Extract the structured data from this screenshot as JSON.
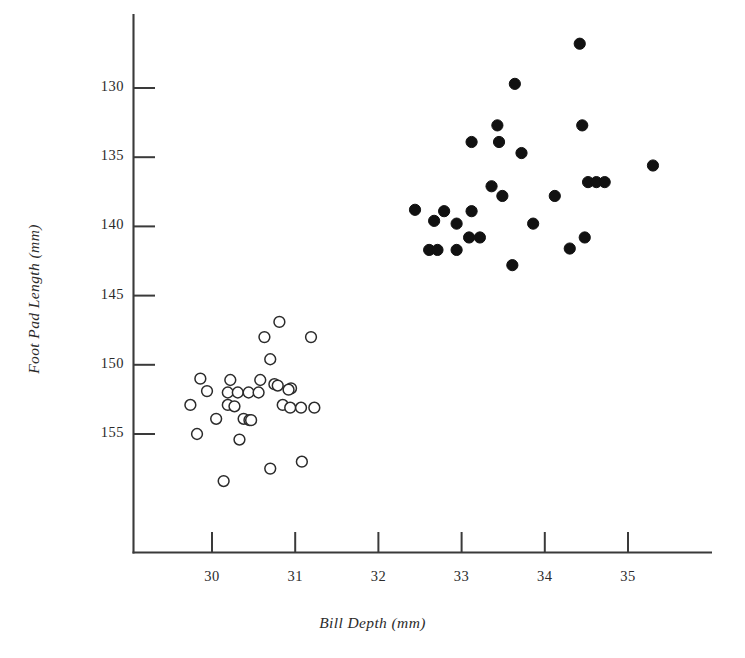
{
  "figure": {
    "background": "#ffffff",
    "ink_color": "#2b2b2b",
    "axis_color": "#3a3a3a"
  },
  "axes": {
    "x_title": "Bill Depth (mm)",
    "y_title": "Foot Pad Length (mm)",
    "x_ticks": [
      "30",
      "31",
      "32",
      "33",
      "34",
      "35"
    ],
    "y_ticks": [
      "155",
      "150",
      "145",
      "140",
      "135",
      "130"
    ]
  },
  "chart_data": {
    "type": "scatter",
    "title": "",
    "xlabel": "Bill Depth (mm)",
    "ylabel": "Foot Pad Length (mm)",
    "xlim": [
      29.5,
      35.95
    ],
    "ylim": [
      126.4,
      158.9
    ],
    "xticks": [
      30,
      31,
      32,
      33,
      34,
      35
    ],
    "yticks": [
      130,
      135,
      140,
      145,
      150,
      155
    ],
    "grid": false,
    "legend": "none",
    "series": [
      {
        "name": "open-circles",
        "marker": "open-circle",
        "fill": "none",
        "stroke": "#2b2b2b",
        "points": [
          [
            29.86,
            134.0
          ],
          [
            30.22,
            133.9
          ],
          [
            30.63,
            137.0
          ],
          [
            30.81,
            138.1
          ],
          [
            31.19,
            137.0
          ],
          [
            30.7,
            135.4
          ],
          [
            30.58,
            133.9
          ],
          [
            30.75,
            133.6
          ],
          [
            30.79,
            133.5
          ],
          [
            30.95,
            133.3
          ],
          [
            30.92,
            133.2
          ],
          [
            29.94,
            133.1
          ],
          [
            30.19,
            133.0
          ],
          [
            30.31,
            133.0
          ],
          [
            30.44,
            133.0
          ],
          [
            30.56,
            133.0
          ],
          [
            29.74,
            132.1
          ],
          [
            30.19,
            132.1
          ],
          [
            30.27,
            132.0
          ],
          [
            30.85,
            132.1
          ],
          [
            30.94,
            131.9
          ],
          [
            31.07,
            131.9
          ],
          [
            31.23,
            131.9
          ],
          [
            30.05,
            131.1
          ],
          [
            30.38,
            131.1
          ],
          [
            30.45,
            131.0
          ],
          [
            30.47,
            131.0
          ],
          [
            29.82,
            130.0
          ],
          [
            30.33,
            129.6
          ],
          [
            30.7,
            127.5
          ],
          [
            31.08,
            128.0
          ],
          [
            30.14,
            126.6
          ]
        ]
      },
      {
        "name": "filled-circles",
        "marker": "filled-circle",
        "fill": "#111111",
        "stroke": "#111111",
        "points": [
          [
            34.42,
            158.2
          ],
          [
            33.64,
            155.3
          ],
          [
            33.43,
            152.3
          ],
          [
            34.45,
            152.3
          ],
          [
            33.12,
            151.1
          ],
          [
            33.45,
            151.1
          ],
          [
            33.72,
            150.3
          ],
          [
            35.3,
            149.4
          ],
          [
            34.52,
            148.2
          ],
          [
            34.62,
            148.2
          ],
          [
            34.72,
            148.2
          ],
          [
            33.36,
            147.9
          ],
          [
            33.49,
            147.2
          ],
          [
            34.12,
            147.2
          ],
          [
            32.44,
            146.2
          ],
          [
            32.79,
            146.1
          ],
          [
            33.12,
            146.1
          ],
          [
            32.67,
            145.4
          ],
          [
            32.94,
            145.2
          ],
          [
            33.86,
            145.2
          ],
          [
            34.48,
            144.2
          ],
          [
            33.09,
            144.2
          ],
          [
            33.22,
            144.2
          ],
          [
            32.61,
            143.3
          ],
          [
            32.71,
            143.3
          ],
          [
            32.94,
            143.3
          ],
          [
            34.3,
            143.4
          ],
          [
            33.61,
            142.2
          ]
        ]
      }
    ]
  }
}
